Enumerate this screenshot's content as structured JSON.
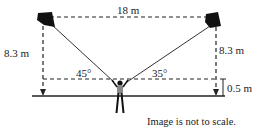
{
  "diagram": {
    "labels": {
      "top_distance": "18 m",
      "left_height": "8.3 m",
      "right_height": "8.3 m",
      "left_angle": "45°",
      "right_angle": "35°",
      "person_height": "0.5 m"
    },
    "note": "Image is not to scale.",
    "colors": {
      "line": "#222222",
      "kite": "#111111",
      "person_body": "#888888"
    }
  }
}
